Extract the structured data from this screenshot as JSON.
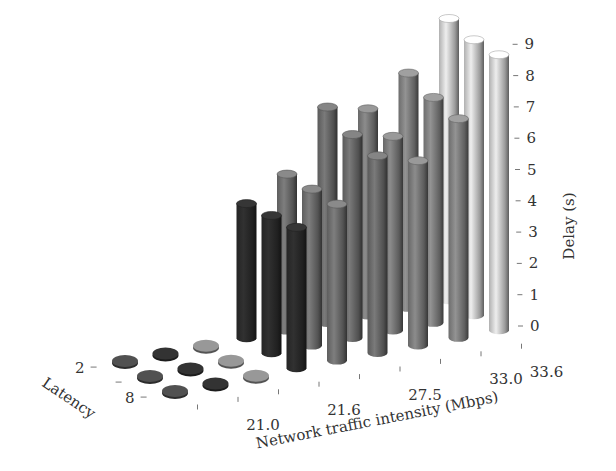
{
  "chart_data": {
    "type": "bar3d",
    "title": "",
    "xlabel": "Network traffic intensity (Mbps)",
    "ylabel": "Latency",
    "zlabel": "Delay (s)",
    "x_tick_labels": [
      "21.0",
      "21.6",
      "27.5",
      "33.0",
      "33.6"
    ],
    "x_categories": [
      "c1",
      "21.0",
      "c3",
      "21.6",
      "c5",
      "27.5",
      "c7",
      "33.0",
      "33.6"
    ],
    "y_tick_labels": [
      "2",
      "",
      "8"
    ],
    "z_ticks": [
      0,
      1,
      2,
      3,
      4,
      5,
      6,
      7,
      8,
      9
    ],
    "zlim": [
      0,
      9
    ],
    "grid": false,
    "legend": null,
    "series": [
      {
        "name": "Latency 2",
        "values": [
          0.1,
          0.1,
          0.1,
          4.3,
          5.0,
          6.9,
          6.6,
          7.5,
          9.0
        ]
      },
      {
        "name": "Latency mid",
        "values": [
          0.1,
          0.1,
          0.1,
          4.4,
          5.0,
          6.5,
          6.2,
          7.2,
          8.8
        ]
      },
      {
        "name": "Latency 8",
        "values": [
          0.1,
          0.1,
          0.1,
          4.5,
          5.0,
          6.3,
          5.9,
          7.0,
          8.8
        ]
      }
    ],
    "column_colors": [
      "#4a4a4a",
      "#2e2e2e",
      "#8a8a8a",
      "#2b2b2b",
      "#6e6e6e",
      "#6a6a6a",
      "#7a7a7a",
      "#808080",
      "#cfcfcf"
    ]
  }
}
